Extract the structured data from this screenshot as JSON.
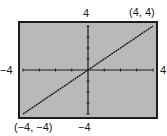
{
  "chart_data": {
    "type": "line",
    "title": "",
    "xlabel": "",
    "ylabel": "",
    "xlim": [
      -4,
      4
    ],
    "ylim": [
      -4,
      4
    ],
    "grid": false,
    "tick_spacing": 1,
    "series": [
      {
        "name": "y = x",
        "x": [
          -4,
          4
        ],
        "y": [
          -4,
          4
        ],
        "style": "dotted-dark"
      }
    ],
    "annotations": [
      {
        "text": "(4, 4)",
        "x": 4,
        "y": 4
      },
      {
        "text": "(−4, −4)",
        "x": -4,
        "y": -4
      }
    ],
    "axis_labels": {
      "xmin": "−4",
      "xmax": "4",
      "ymin": "−4",
      "ymax": "4"
    }
  },
  "labels": {
    "ymax": "4",
    "ymin": "−4",
    "xmin": "−4",
    "xmax": "4",
    "point_max": "(4, 4)",
    "point_min": "(−4, −4)"
  },
  "colors": {
    "screen_bg": "#b9b9b9",
    "frame": "#1e1e1e",
    "line": "#1a1a1a"
  }
}
